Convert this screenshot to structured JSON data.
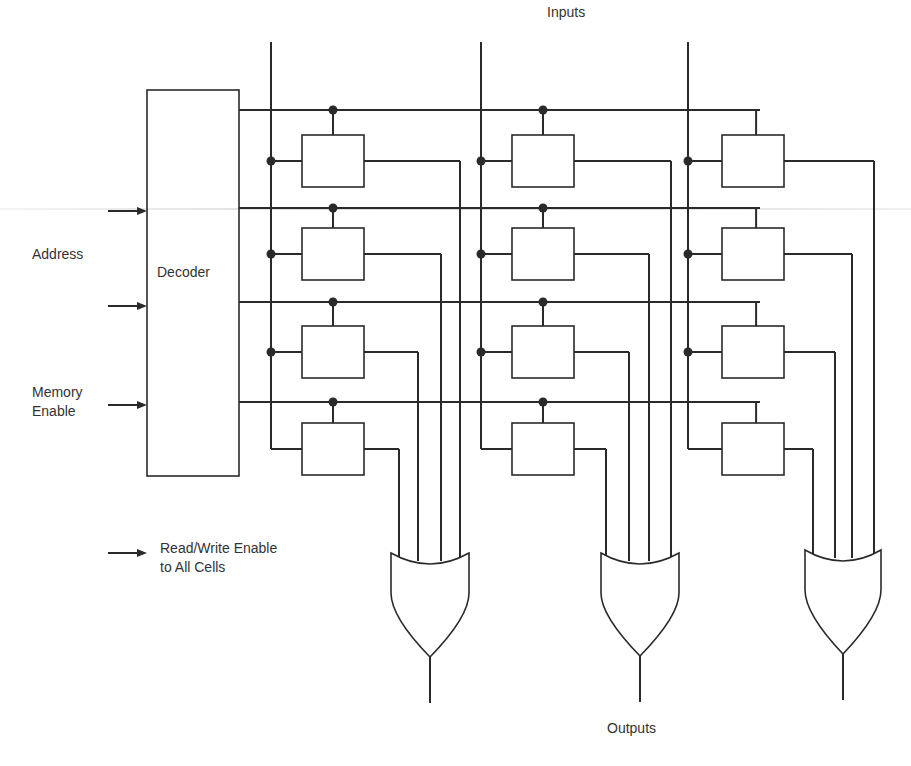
{
  "labels": {
    "inputs": "Inputs",
    "outputs": "Outputs",
    "decoder": "Decoder",
    "address": "Address",
    "memory_enable_line1": "Memory",
    "memory_enable_line2": "Enable",
    "rw_enable_line1": "Read/Write Enable",
    "rw_enable_line2": "to All Cells"
  },
  "colors": {
    "line": "#2a2a2a",
    "background": "#ffffff",
    "text": "#333333"
  },
  "geometry": {
    "decoder": {
      "x": 147,
      "y": 90,
      "w": 92,
      "h": 386
    },
    "input_lines_x": [
      271,
      481,
      688
    ],
    "input_lines_top": 42,
    "word_lines_y": [
      110,
      208,
      302,
      402
    ],
    "cell_columns_x": [
      302,
      512,
      722
    ],
    "cell_rows_y": [
      135,
      228,
      326,
      423
    ],
    "cell_size": {
      "w": 62,
      "h": 52
    },
    "or_gates": [
      {
        "cx": 430,
        "top": 553,
        "w": 78,
        "tip": 657,
        "out_end": 703,
        "inputs_x": [
          399,
          418,
          441,
          460
        ]
      },
      {
        "cx": 640,
        "top": 553,
        "w": 78,
        "tip": 656,
        "out_end": 702,
        "inputs_x": [
          606,
          629,
          649,
          671
        ]
      },
      {
        "cx": 843,
        "top": 550,
        "w": 76,
        "tip": 654,
        "out_end": 700,
        "inputs_x": [
          813,
          835,
          852,
          874
        ]
      }
    ],
    "arrows": [
      {
        "name": "address-arrow-1",
        "x1": 108,
        "y": 211,
        "x2": 147
      },
      {
        "name": "address-arrow-2",
        "x1": 108,
        "y": 306,
        "x2": 147
      },
      {
        "name": "memory-enable-arrow",
        "x1": 108,
        "y": 405,
        "x2": 147
      },
      {
        "name": "rw-enable-arrow",
        "x1": 108,
        "y": 553,
        "x2": 147
      }
    ]
  }
}
